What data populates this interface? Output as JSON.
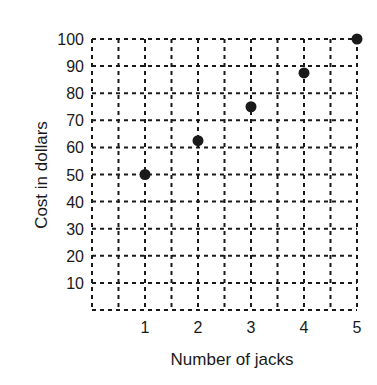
{
  "chart_data": {
    "type": "scatter",
    "title": "",
    "xlabel": "Number of jacks",
    "ylabel": "Cost in dollars",
    "x": [
      1,
      2,
      3,
      4,
      5
    ],
    "values": [
      50,
      62.5,
      75,
      87.5,
      100
    ],
    "series": [
      {
        "name": "Cost",
        "x": [
          1,
          2,
          3,
          4,
          5
        ],
        "values": [
          50,
          62.5,
          75,
          87.5,
          100
        ]
      }
    ],
    "x_ticks": [
      "1",
      "2",
      "3",
      "4",
      "5"
    ],
    "y_ticks": [
      "10",
      "20",
      "30",
      "40",
      "50",
      "60",
      "70",
      "80",
      "90",
      "100"
    ],
    "xlim": [
      0,
      5
    ],
    "ylim": [
      0,
      100
    ],
    "grid": true,
    "grid_style": "dotted",
    "grid_x_step": 0.5,
    "grid_y_step": 10,
    "legend": "none",
    "marker_color": "#1a1a1a"
  }
}
